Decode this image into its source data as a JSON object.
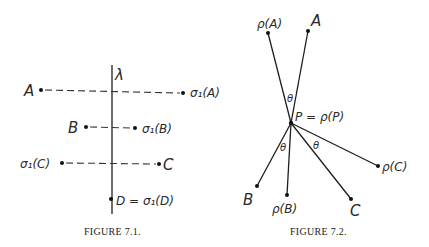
{
  "figure_7_1": {
    "caption": "FIGURE 7.1.",
    "line_label": "λ",
    "points": {
      "A": "A",
      "sigma_A": "σ₁(A)",
      "B": "B",
      "sigma_B": "σ₁(B)",
      "sigma_C": "σ₁(C)",
      "C": "C",
      "D_eq": "D = σ₁(D)"
    }
  },
  "figure_7_2": {
    "caption": "FIGURE 7.2.",
    "center_label": "P = ρ(P)",
    "angle_label": "θ",
    "points": {
      "rho_A": "ρ(A)",
      "A": "A",
      "B": "B",
      "rho_B": "ρ(B)",
      "C": "C",
      "rho_C": "ρ(C)"
    }
  }
}
